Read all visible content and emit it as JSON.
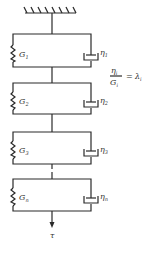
{
  "diagram": {
    "type": "generalized-kelvin-voigt-model",
    "ceiling": {
      "label": "fixed support"
    },
    "elements": [
      {
        "spring_label": "G",
        "spring_sub": "1",
        "dashpot_label": "η",
        "dashpot_sub": "1"
      },
      {
        "spring_label": "G",
        "spring_sub": "2",
        "dashpot_label": "η",
        "dashpot_sub": "2"
      },
      {
        "spring_label": "G",
        "spring_sub": "3",
        "dashpot_label": "η",
        "dashpot_sub": "3"
      },
      {
        "spring_label": "G",
        "spring_sub": "n",
        "dashpot_label": "η",
        "dashpot_sub": "n"
      }
    ],
    "equation": {
      "numerator": "η",
      "numerator_sub": "i",
      "denominator": "G",
      "denominator_sub": "i",
      "equals": "=",
      "rhs": "λ",
      "rhs_sub": "i"
    },
    "load": {
      "label": "τ"
    }
  }
}
